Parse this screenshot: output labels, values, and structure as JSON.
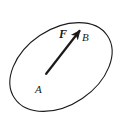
{
  "figure": {
    "background_color": "#ffffff",
    "stroke_color": "#1a1a1a",
    "surface": {
      "shape_name": "ellipse",
      "center_x": 61,
      "center_y": 67,
      "radius_x": 56,
      "radius_y": 38,
      "rotation_deg": -34,
      "stroke_width": 1.1,
      "fill": "none"
    },
    "vector": {
      "label": "F",
      "tail_x": 46,
      "tail_y": 74,
      "head_x": 81,
      "head_y": 29,
      "stroke_width": 2.2,
      "arrowhead_length": 9,
      "arrowhead_width": 5
    },
    "labels": {
      "force": "F",
      "point_b": "B",
      "point_a": "A"
    }
  }
}
